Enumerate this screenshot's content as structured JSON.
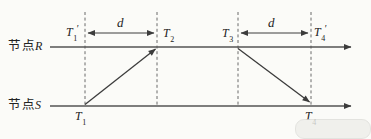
{
  "diagram": {
    "nodes": {
      "r": {
        "prefix": "节点",
        "suffix": "R"
      },
      "s": {
        "prefix": "节点",
        "suffix": "S"
      }
    },
    "distance_labels": {
      "left": "d",
      "right": "d"
    },
    "timestamps": {
      "t1_prime": {
        "base": "T",
        "sub": "1",
        "prime": "′"
      },
      "t2": {
        "base": "T",
        "sub": "2",
        "prime": ""
      },
      "t3": {
        "base": "T",
        "sub": "3",
        "prime": ""
      },
      "t4_prime": {
        "base": "T",
        "sub": "4",
        "prime": "′"
      },
      "t1": {
        "base": "T",
        "sub": "1",
        "prime": ""
      },
      "t4": {
        "base": "T",
        "sub": "4",
        "prime": ""
      }
    },
    "colors": {
      "line": "#555555",
      "arrow": "#3c3c3c",
      "dash": "#6a6a6a",
      "text": "#222222",
      "background": "#fbfbf8"
    }
  }
}
